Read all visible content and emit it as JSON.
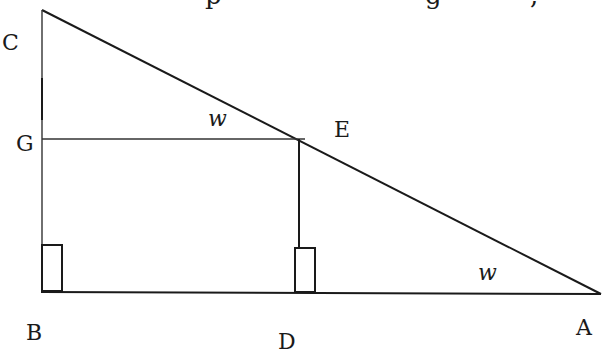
{
  "diagram": {
    "top_cutoff_text": "p          g     ,",
    "points": {
      "C": {
        "label": "C",
        "x": 42,
        "y": 10
      },
      "B": {
        "label": "B",
        "x": 41,
        "y": 291
      },
      "A": {
        "label": "A",
        "x": 601,
        "y": 294
      },
      "E": {
        "label": "E",
        "x": 299,
        "y": 139
      },
      "G": {
        "label": "G",
        "x": 42,
        "y": 138
      },
      "D": {
        "label": "D",
        "x": 299,
        "y": 292
      }
    },
    "angle_labels": [
      {
        "label": "w",
        "at": "E",
        "x": 208,
        "y": 126
      },
      {
        "label": "w",
        "at": "A",
        "x": 478,
        "y": 280
      }
    ],
    "right_angle_markers": [
      {
        "at": "B",
        "x": 42,
        "y": 245,
        "w": 20,
        "h": 46
      },
      {
        "at": "D",
        "x": 295,
        "y": 248,
        "w": 20,
        "h": 44
      }
    ],
    "segments": [
      [
        "C",
        "A"
      ],
      [
        "C",
        "B"
      ],
      [
        "B",
        "A"
      ],
      [
        "G",
        "E"
      ],
      [
        "E",
        "D"
      ]
    ],
    "colors": {
      "stroke": "#1a1a1a",
      "background": "#ffffff"
    }
  }
}
